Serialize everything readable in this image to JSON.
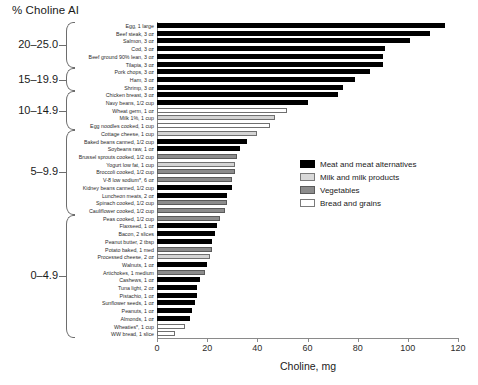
{
  "chart_data": {
    "type": "bar",
    "orientation": "horizontal",
    "title": "% Choline AI",
    "xlabel": "Choline, mg",
    "ylabel": "",
    "xlim": [
      0,
      120
    ],
    "xticks": [
      0,
      20,
      40,
      60,
      80,
      100,
      120
    ],
    "grid": false,
    "legend_position": "right-middle",
    "legend": [
      {
        "label": "Meat and meat alternatives",
        "key": "meat",
        "color": "#000000"
      },
      {
        "label": "Milk and milk products",
        "key": "milk",
        "color": "#d9d9d9"
      },
      {
        "label": "Vegetables",
        "key": "veg",
        "color": "#8c8c8c"
      },
      {
        "label": "Bread and grains",
        "key": "bread",
        "color": "#ffffff"
      }
    ],
    "group_brackets": [
      {
        "label": "20–25.0",
        "from": 0,
        "to": 5
      },
      {
        "label": "15–19.9",
        "from": 6,
        "to": 8
      },
      {
        "label": "10–14.9",
        "from": 9,
        "to": 13
      },
      {
        "label": "5–9.9",
        "from": 14,
        "to": 24
      },
      {
        "label": "0–4.9",
        "from": 25,
        "to": 40
      }
    ],
    "categories": [
      "Egg, 1 large",
      "Beef steak, 3 oz",
      "Salmon, 3 oz",
      "Cod, 3 oz",
      "Beef ground 90% lean, 3 oz",
      "Tilapia, 3 oz",
      "Pork chops, 3 oz",
      "Ham, 3 oz",
      "Shrimp, 3 oz",
      "Chicken breast, 3 oz",
      "Navy beans, 1/2 cup",
      "Wheat germ, 1 oz",
      "Milk 1%, 1 cup",
      "Egg noodles cooked, 1 cup",
      "Cottage cheese, 1 cup",
      "Baked beans canned, 1/2 cup",
      "Soybeans raw, 1 oz",
      "Brussel sprouts cooked, 1/2 cup",
      "Yogurt low fat, 1 cup",
      "Broccoli cooked, 1/2 cup",
      "V-8 low sodium*, 6 oz",
      "Kidney beans canned, 1/2 cup",
      "Luncheon meats, 2 oz",
      "Spinach cooked, 1/2 cup",
      "Cauliflower cooked, 1/2 cup",
      "Peas cooked, 1/2 cup",
      "Flaxseed, 1 oz",
      "Bacon, 2 slices",
      "Peanut butter, 2 tbsp",
      "Potato baked, 1 med",
      "Processed cheese, 2 oz",
      "Walnuts, 1 oz",
      "Artichokes, 1 medium",
      "Cashews, 1 oz",
      "Tuna light, 2 oz",
      "Pistachio, 1 oz",
      "Sunflower seeds, 1 oz",
      "Peanuts, 1 oz",
      "Almonds, 1 oz",
      "Wheaties*, 1 cup",
      "WW bread, 1 slice"
    ],
    "values": [
      115,
      109,
      101,
      91,
      90,
      90,
      85,
      79,
      74,
      72,
      60,
      52,
      47,
      45,
      40,
      36,
      33,
      32,
      31,
      31,
      30,
      30,
      28,
      28,
      27,
      25,
      24,
      23,
      22,
      22,
      21,
      20,
      19,
      17,
      16,
      16,
      15,
      14,
      13,
      11,
      7
    ],
    "series_keys": [
      "meat",
      "meat",
      "meat",
      "meat",
      "meat",
      "meat",
      "meat",
      "meat",
      "meat",
      "meat",
      "meat",
      "bread",
      "milk",
      "bread",
      "milk",
      "meat",
      "meat",
      "veg",
      "milk",
      "veg",
      "veg",
      "meat",
      "meat",
      "veg",
      "veg",
      "veg",
      "meat",
      "meat",
      "meat",
      "veg",
      "milk",
      "meat",
      "veg",
      "meat",
      "meat",
      "meat",
      "meat",
      "meat",
      "meat",
      "bread",
      "bread"
    ]
  }
}
